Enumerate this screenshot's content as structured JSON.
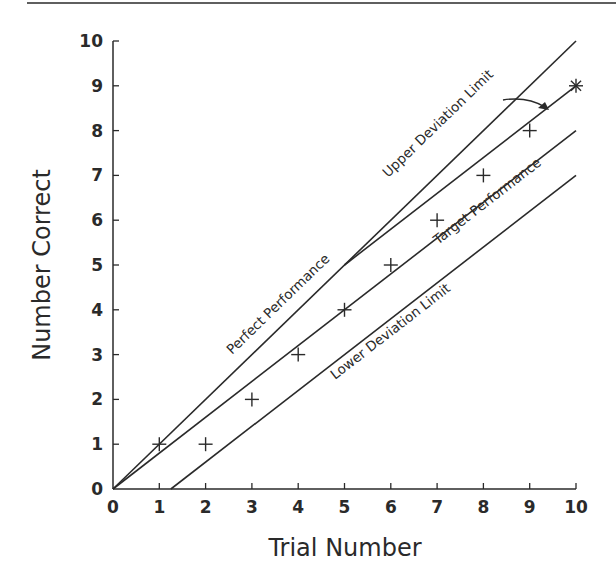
{
  "chart_data": {
    "type": "line",
    "title": "",
    "xlabel": "Trial Number",
    "ylabel": "Number Correct",
    "xlim": [
      0,
      10
    ],
    "ylim": [
      0,
      10
    ],
    "x_ticks": [
      0,
      1,
      2,
      3,
      4,
      5,
      6,
      7,
      8,
      9,
      10
    ],
    "y_ticks": [
      0,
      1,
      2,
      3,
      4,
      5,
      6,
      7,
      8,
      9,
      10
    ],
    "grid": false,
    "legend": "none (inline line labels)",
    "series": [
      {
        "name": "Perfect Performance",
        "kind": "line",
        "points": [
          [
            0,
            0
          ],
          [
            10,
            10
          ]
        ]
      },
      {
        "name": "Upper Deviation Limit",
        "kind": "line",
        "points": [
          [
            5,
            5
          ],
          [
            10,
            9
          ]
        ]
      },
      {
        "name": "Target Performance",
        "kind": "line",
        "points": [
          [
            0,
            0
          ],
          [
            10,
            8
          ]
        ]
      },
      {
        "name": "Lower Deviation Limit",
        "kind": "line",
        "points": [
          [
            1.25,
            0
          ],
          [
            10,
            7
          ]
        ]
      },
      {
        "name": "Observed Trials",
        "kind": "scatter",
        "marker": "+",
        "x": [
          1,
          2,
          3,
          4,
          5,
          6,
          7,
          8,
          9,
          10
        ],
        "y": [
          1,
          1,
          2,
          3,
          4,
          5,
          6,
          7,
          8,
          9
        ],
        "final_marker": "*"
      }
    ],
    "annotations": [
      {
        "text": "arrow pointing from Upper Deviation Limit label to final point",
        "target": [
          10,
          9
        ]
      }
    ]
  },
  "labels": {
    "perfect": "Perfect Performance",
    "upper": "Upper Deviation Limit",
    "target": "Target Performance",
    "lower": "Lower Deviation Limit"
  },
  "colors": {
    "ink": "#2a2a2a",
    "background": "#ffffff"
  }
}
